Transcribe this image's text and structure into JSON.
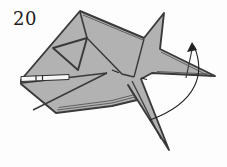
{
  "figure": {
    "step_label": "20",
    "colors": {
      "paper": "#b2b2b2",
      "outline": "#3a3a3a",
      "thin_edge": "#4a4a4a",
      "arrow": "#222222",
      "slit": "#f6f6f6"
    }
  }
}
